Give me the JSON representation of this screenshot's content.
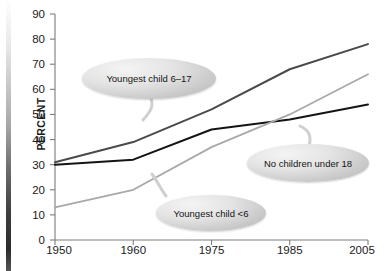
{
  "axis": {
    "y_title": "PERCENT",
    "y_ticks": [
      0,
      10,
      20,
      30,
      40,
      50,
      60,
      70,
      80,
      90
    ],
    "x_ticks": [
      "1950",
      "1960",
      "1975",
      "1985",
      "2005"
    ]
  },
  "callouts": [
    {
      "id": "youngest-6-17",
      "label": "Youngest child 6–17"
    },
    {
      "id": "no-children",
      "label": "No children under 18"
    },
    {
      "id": "youngest-under-6",
      "label": "Youngest child <6"
    }
  ],
  "colors": {
    "series_youngest_6_17": "#4a4a4a",
    "series_no_children": "#141414",
    "series_youngest_under_6": "#a9a9a9",
    "axis": "#7c7c7c",
    "text": "#1a1a1a"
  },
  "chart_data": {
    "type": "line",
    "title": "",
    "xlabel": "",
    "ylabel": "PERCENT",
    "x": [
      "1950",
      "1960",
      "1975",
      "1985",
      "2005"
    ],
    "ylim": [
      0,
      90
    ],
    "ytick_step": 10,
    "grid": false,
    "legend": "annotations",
    "series": [
      {
        "name": "Youngest child 6–17",
        "color": "#4a4a4a",
        "values": [
          31,
          39,
          52,
          68,
          78
        ]
      },
      {
        "name": "No children under 18",
        "color": "#141414",
        "values": [
          30,
          32,
          44,
          48,
          54
        ]
      },
      {
        "name": "Youngest child <6",
        "color": "#a9a9a9",
        "values": [
          13,
          20,
          37,
          50,
          66
        ]
      }
    ]
  }
}
